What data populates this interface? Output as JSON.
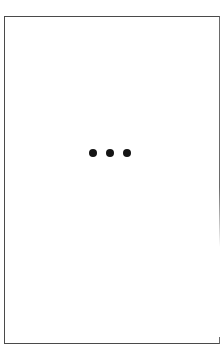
{
  "panel": {
    "border_color": "#4a4a4a",
    "background": "#ffffff"
  },
  "more_indicator": {
    "icon": "ellipsis-icon",
    "dot_count": 3,
    "dot_color": "#141414"
  }
}
